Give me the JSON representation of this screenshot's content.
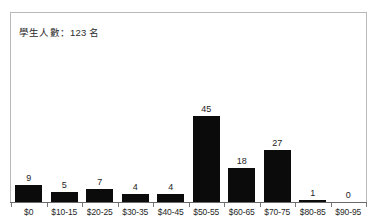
{
  "annotation": {
    "text": "學生人數：123 名"
  },
  "chart_data": {
    "type": "bar",
    "title": "",
    "subtitle": "",
    "xlabel": "",
    "ylabel": "",
    "categories": [
      "$0",
      "$10-15",
      "$20-25",
      "$30-35",
      "$40-45",
      "$50-55",
      "$60-65",
      "$70-75",
      "$80-85",
      "$90-95"
    ],
    "values": [
      9,
      5,
      7,
      4,
      4,
      45,
      18,
      27,
      1,
      0
    ],
    "value_labels": [
      "9",
      "5",
      "7",
      "4",
      "4",
      "45",
      "18",
      "27",
      "1",
      "0"
    ],
    "ylim": [
      0,
      50
    ],
    "grid": false,
    "legend": false,
    "legend_position": "none",
    "annotations": [
      "學生人數：123 名"
    ],
    "bar_color": "#0b0b0b",
    "frame_color": "#b9b9b9",
    "axis_color": "#6b6b6b",
    "background_color": "#ffffff"
  }
}
